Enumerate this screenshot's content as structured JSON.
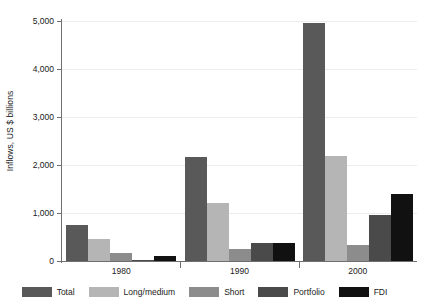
{
  "chart_data": {
    "type": "bar",
    "title": "",
    "xlabel": "",
    "ylabel": "Inflows, US $ billions",
    "categories": [
      "1980",
      "1990",
      "2000"
    ],
    "ylim": [
      0,
      5000
    ],
    "yticks": [
      0,
      1000,
      2000,
      3000,
      4000,
      5000
    ],
    "ytick_labels": [
      "0",
      "1,000",
      "2,000",
      "3,000",
      "4,000",
      "5,000"
    ],
    "grid": true,
    "legend_position": "bottom",
    "series": [
      {
        "name": "Total",
        "color": "#595959",
        "values": [
          750,
          2165,
          4960
        ]
      },
      {
        "name": "Long/medium",
        "color": "#b5b5b5",
        "values": [
          460,
          1200,
          2190
        ]
      },
      {
        "name": "Short",
        "color": "#8c8c8c",
        "values": [
          170,
          250,
          340
        ]
      },
      {
        "name": "Portfolio",
        "color": "#4a4a4a",
        "values": [
          15,
          370,
          960
        ]
      },
      {
        "name": "FDI",
        "color": "#111111",
        "values": [
          100,
          375,
          1400
        ]
      }
    ]
  },
  "legend": {
    "items": [
      {
        "label": "Total",
        "color": "#595959"
      },
      {
        "label": "Long/medium",
        "color": "#b5b5b5"
      },
      {
        "label": "Short",
        "color": "#8c8c8c"
      },
      {
        "label": "Portfolio",
        "color": "#4a4a4a"
      },
      {
        "label": "FDI",
        "color": "#111111"
      }
    ]
  }
}
